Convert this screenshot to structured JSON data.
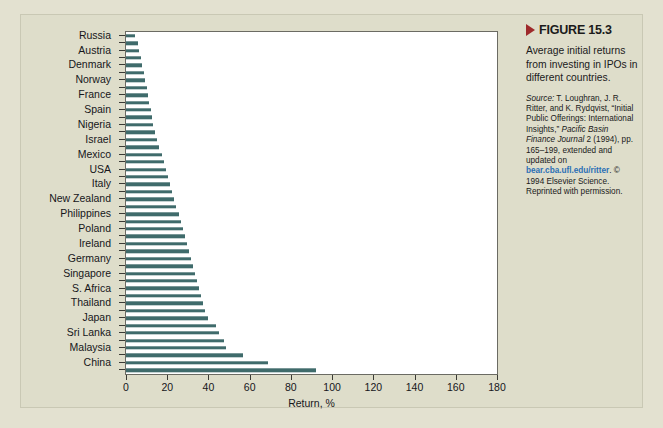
{
  "figure": {
    "marker_icon": "triangle-right-icon",
    "label": "FIGURE 15.3",
    "caption": "Average initial returns from investing in IPOs in different countries.",
    "source": {
      "lead": "Source:",
      "text_1": " T. Loughran, J. R. Ritter, and K. Rydqvist, “Initial Public Offerings: International Insights,” ",
      "journal": "Pacific Basin Finance Journal",
      "text_2": " 2 (1994), pp. 165–199, extended and updated on ",
      "link": "bear.cba.ufl.edu/ritter",
      "text_3": ". © 1994 Elsevier Science. Reprinted with permission."
    }
  },
  "colors": {
    "page_background": "#e3e1d0",
    "card_background": "#deddca",
    "plot_background": "#ffffff",
    "bar": "#3f6b6b",
    "axis": "#3a3a34",
    "marker_red": "#9e2a2b",
    "link_blue": "#2b6fb5"
  },
  "chart_data": {
    "type": "bar",
    "orientation": "horizontal",
    "title": "",
    "xlabel": "Return, %",
    "ylabel": "",
    "xlim": [
      0,
      180
    ],
    "ylim": null,
    "grid": false,
    "legend": null,
    "xticks": [
      0,
      20,
      40,
      60,
      80,
      100,
      120,
      140,
      160,
      180
    ],
    "categories": [
      "Russia",
      "",
      "Austria",
      "",
      "Denmark",
      "",
      "Norway",
      "",
      "France",
      "",
      "Spain",
      "",
      "Nigeria",
      "",
      "Israel",
      "",
      "Mexico",
      "",
      "USA",
      "",
      "Italy",
      "",
      "New Zealand",
      "",
      "Philippines",
      "",
      "Poland",
      "",
      "Ireland",
      "",
      "Germany",
      "",
      "Singapore",
      "",
      "S. Africa",
      "",
      "Thailand",
      "",
      "Japan",
      "",
      "Sri Lanka",
      "",
      "Malaysia",
      "",
      "China",
      ""
    ],
    "labeled_categories": [
      "Russia",
      "Austria",
      "Denmark",
      "Norway",
      "France",
      "Spain",
      "Nigeria",
      "Israel",
      "Mexico",
      "USA",
      "Italy",
      "New Zealand",
      "Philippines",
      "Poland",
      "Ireland",
      "Germany",
      "Singapore",
      "S. Africa",
      "Thailand",
      "Japan",
      "Sri Lanka",
      "Malaysia",
      "China"
    ],
    "values": [
      4.2,
      5.8,
      6.5,
      7.4,
      8.0,
      8.6,
      9.2,
      10.0,
      10.7,
      11.4,
      12.0,
      12.6,
      13.2,
      14.0,
      15.0,
      16.0,
      17.5,
      18.6,
      19.5,
      20.5,
      21.5,
      22.5,
      23.5,
      24.5,
      25.5,
      26.5,
      27.5,
      28.5,
      29.5,
      30.5,
      31.5,
      32.5,
      33.5,
      34.5,
      35.5,
      36.5,
      37.5,
      38.5,
      40.0,
      43.5,
      45.0,
      47.5,
      48.5,
      57.0,
      69.0,
      92.0
    ],
    "bar_count": 46,
    "note": "Every other bar carries a country tick label; intermediate bars are unlabeled."
  }
}
